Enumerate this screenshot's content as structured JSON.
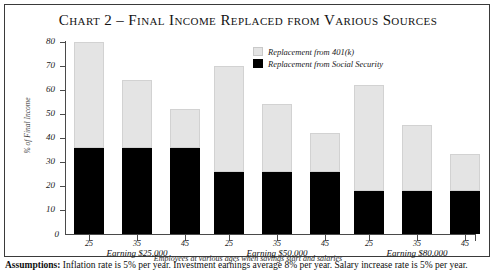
{
  "title": "Chart 2 – Final Income Replaced from Various Sources",
  "legend": {
    "items": [
      {
        "label": "Replacement from 401(k)",
        "color": "#e4e4e4",
        "name": "legend-401k"
      },
      {
        "label": "Replacement from Social Security",
        "color": "#000000",
        "name": "legend-social-security"
      }
    ]
  },
  "axis": {
    "y_label": "% of Final Income",
    "y_ticks": [
      "10",
      "20",
      "30",
      "40",
      "50",
      "60",
      "70",
      "80"
    ],
    "y_zero": "0",
    "x_caption": "Employees at various ages when savings start and salaries"
  },
  "groups": [
    {
      "label": "Earning $25,000",
      "ages": [
        "25",
        "35",
        "45"
      ]
    },
    {
      "label": "Earning $50,000",
      "ages": [
        "25",
        "35",
        "45"
      ]
    },
    {
      "label": "Earning $80,000",
      "ages": [
        "25",
        "35",
        "45"
      ]
    }
  ],
  "footnote": {
    "bold": "Assumptions:",
    "text": " Inflation rate is 5% per year. Investment earnings average 8% per year. Salary increase rate is 5% per year."
  },
  "chart_data": {
    "type": "bar",
    "title": "Chart 2 – Final Income Replaced from Various Sources",
    "subtype": "stacked",
    "xlabel": "Employees at various ages when savings start and salaries",
    "ylabel": "% of Final Income",
    "ylim": [
      0,
      80
    ],
    "ytick_step": 10,
    "grid": false,
    "legend_position": "top-right",
    "categories": [
      "Earning $25,000 / age 25",
      "Earning $25,000 / age 35",
      "Earning $25,000 / age 45",
      "Earning $50,000 / age 25",
      "Earning $50,000 / age 35",
      "Earning $50,000 / age 45",
      "Earning $80,000 / age 25",
      "Earning $80,000 / age 35",
      "Earning $80,000 / age 45"
    ],
    "series": [
      {
        "name": "Replacement from Social Security",
        "color": "#000000",
        "values": [
          36,
          36,
          36,
          26,
          26,
          26,
          18,
          18,
          18
        ]
      },
      {
        "name": "Replacement from 401(k)",
        "color": "#e4e4e4",
        "values": [
          44,
          28,
          16,
          44,
          28,
          16,
          44,
          27.5,
          15.5
        ]
      }
    ],
    "totals": [
      80,
      64,
      52,
      70,
      54,
      42,
      62,
      45.5,
      33.5
    ],
    "annotations": [
      "Assumptions: Inflation rate is 5% per year. Investment earnings average 8% per year. Salary increase rate is 5% per year."
    ]
  }
}
